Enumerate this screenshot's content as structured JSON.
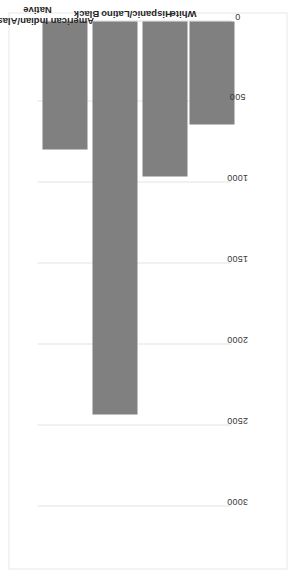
{
  "chart_data": {
    "type": "bar",
    "orientation": "horizontal",
    "title": "",
    "subtitle": "",
    "xlabel": "",
    "ylabel": "",
    "categories": [
      "White",
      "Hispanic/Latino",
      "Black",
      "American Indian/Alaskan Native"
    ],
    "values": [
      640,
      960,
      2430,
      790
    ],
    "series": [
      {
        "name": "",
        "values": [
          640,
          960,
          2430,
          790
        ]
      }
    ],
    "value_axis": {
      "ticks": [
        0,
        500,
        1000,
        1500,
        2000,
        2500,
        3000
      ],
      "tick_labels": [
        "0",
        "500",
        "1000",
        "1500",
        "2000",
        "2500",
        "3000"
      ],
      "lim": [
        0,
        3000
      ],
      "reversed": true
    },
    "grid": true,
    "legend": false,
    "legend_position": "none",
    "bar_color": "#808080",
    "grid_color": "#e3e3e3",
    "frame_color": "#e8e8e8",
    "background": "#ffffff",
    "rotation_deg": -90,
    "annotations": []
  },
  "axis": {
    "tick_labels": [
      "3000",
      "2500",
      "2000",
      "1500",
      "1000",
      "500",
      "0"
    ]
  },
  "bars": [
    {
      "label": "American Indian/Alaskan Native",
      "value": 790
    },
    {
      "label": "Black",
      "value": 2430
    },
    {
      "label": "Hispanic/Latino",
      "value": 960
    },
    {
      "label": "White",
      "value": 640
    }
  ]
}
